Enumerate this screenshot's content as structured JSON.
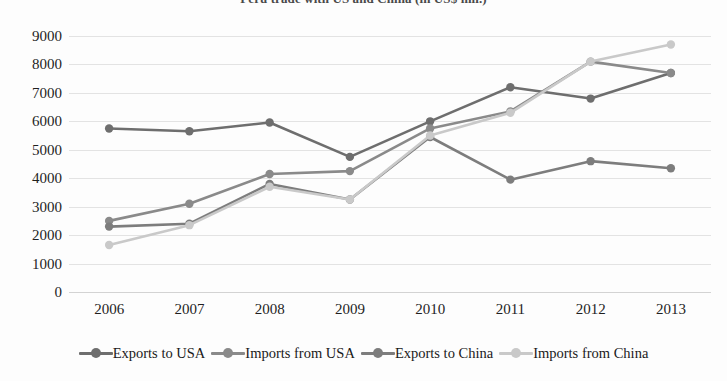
{
  "chart_data": {
    "type": "line",
    "title": "Peru trade with US and China (in US$ mil.)",
    "xlabel": "",
    "ylabel": "",
    "categories": [
      "2006",
      "2007",
      "2008",
      "2009",
      "2010",
      "2011",
      "2012",
      "2013"
    ],
    "x": [
      2006,
      2007,
      2008,
      2009,
      2010,
      2011,
      2012,
      2013
    ],
    "ylim": [
      0,
      9000
    ],
    "ytick_labels": [
      "0",
      "1000",
      "2000",
      "3000",
      "4000",
      "5000",
      "6000",
      "7000",
      "8000",
      "9000"
    ],
    "yticks": [
      0,
      1000,
      2000,
      3000,
      4000,
      5000,
      6000,
      7000,
      8000,
      9000
    ],
    "grid": true,
    "legend_position": "bottom",
    "series": [
      {
        "name": "Exports to USA",
        "color": "#6e6e6e",
        "values": [
          5750,
          5650,
          5960,
          4750,
          6000,
          7200,
          6800,
          7700
        ]
      },
      {
        "name": "Imports from USA",
        "color": "#8a8a8a",
        "values": [
          2500,
          3100,
          4150,
          4250,
          5750,
          6350,
          8100,
          7700
        ]
      },
      {
        "name": "Exports to China",
        "color": "#7d7d7d",
        "values": [
          2300,
          2400,
          3800,
          3250,
          5450,
          3950,
          4600,
          4350
        ]
      },
      {
        "name": "Imports from China",
        "color": "#c9c9c9",
        "values": [
          1650,
          2350,
          3700,
          3250,
          5500,
          6300,
          8100,
          8700
        ]
      }
    ]
  },
  "legend": {
    "entries": [
      {
        "label": "Exports to USA",
        "color": "#6e6e6e"
      },
      {
        "label": "Imports from USA",
        "color": "#8a8a8a"
      },
      {
        "label": "Exports to China",
        "color": "#7d7d7d"
      },
      {
        "label": "Imports from China",
        "color": "#c9c9c9"
      }
    ]
  }
}
